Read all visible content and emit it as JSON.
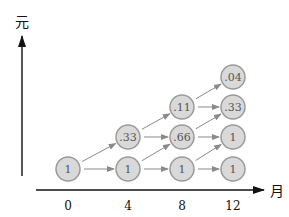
{
  "diagram": {
    "y_axis_label": "元",
    "x_axis_label": "月",
    "x_ticks": [
      {
        "label": "0",
        "x": 68
      },
      {
        "label": "4",
        "x": 128
      },
      {
        "label": "8",
        "x": 182
      },
      {
        "label": "12",
        "x": 233
      }
    ],
    "rows_y": [
      169,
      137,
      107,
      77
    ],
    "nodes": [
      {
        "id": "n0_0",
        "col": 0,
        "row": 0,
        "label": "1"
      },
      {
        "id": "n1_0",
        "col": 1,
        "row": 0,
        "label": "1"
      },
      {
        "id": "n1_1",
        "col": 1,
        "row": 1,
        "label": ".33"
      },
      {
        "id": "n2_0",
        "col": 2,
        "row": 0,
        "label": "1"
      },
      {
        "id": "n2_1",
        "col": 2,
        "row": 1,
        "label": ".66"
      },
      {
        "id": "n2_2",
        "col": 2,
        "row": 2,
        "label": ".11"
      },
      {
        "id": "n3_0",
        "col": 3,
        "row": 0,
        "label": "1"
      },
      {
        "id": "n3_1",
        "col": 3,
        "row": 1,
        "label": "1"
      },
      {
        "id": "n3_2",
        "col": 3,
        "row": 2,
        "label": ".33"
      },
      {
        "id": "n3_3",
        "col": 3,
        "row": 3,
        "label": ".04"
      }
    ],
    "colors": {
      "node_fill": "#d9d9d9",
      "node_stroke": "#9a9a9a",
      "edge": "#8a8a8a",
      "axis": "#111111"
    }
  }
}
